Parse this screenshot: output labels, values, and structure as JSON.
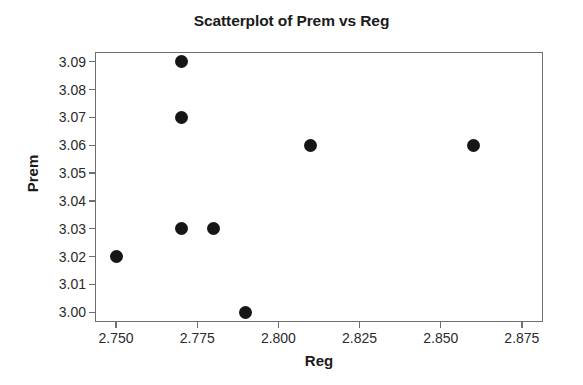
{
  "chart_data": {
    "type": "scatter",
    "title": "Scatterplot of Prem vs Reg",
    "xlabel": "Reg",
    "ylabel": "Prem",
    "xlim": [
      2.7435,
      2.8815
    ],
    "ylim": [
      2.9965,
      3.0935
    ],
    "grid": false,
    "legend": null,
    "xticks": [
      2.75,
      2.775,
      2.8,
      2.825,
      2.85,
      2.875
    ],
    "xtick_labels": [
      "2.750",
      "2.775",
      "2.800",
      "2.825",
      "2.850",
      "2.875"
    ],
    "yticks": [
      3.0,
      3.01,
      3.02,
      3.03,
      3.04,
      3.05,
      3.06,
      3.07,
      3.08,
      3.09
    ],
    "ytick_labels": [
      "3.00",
      "3.01",
      "3.02",
      "3.03",
      "3.04",
      "3.05",
      "3.06",
      "3.07",
      "3.08",
      "3.09"
    ],
    "marker": "filled-circle",
    "marker_color": "#161616",
    "x": [
      2.75,
      2.77,
      2.77,
      2.77,
      2.78,
      2.79,
      2.81,
      2.86
    ],
    "y": [
      3.02,
      3.09,
      3.07,
      3.03,
      3.03,
      3.0,
      3.06,
      3.06
    ],
    "points": [
      {
        "x": 2.75,
        "y": 3.02
      },
      {
        "x": 2.77,
        "y": 3.09
      },
      {
        "x": 2.77,
        "y": 3.07
      },
      {
        "x": 2.77,
        "y": 3.03
      },
      {
        "x": 2.78,
        "y": 3.03
      },
      {
        "x": 2.79,
        "y": 3.0
      },
      {
        "x": 2.81,
        "y": 3.06
      },
      {
        "x": 2.86,
        "y": 3.06
      }
    ]
  },
  "colors": {
    "axis": "#6f6f6f",
    "text": "#2b2b2b",
    "title": "#1b1b1b",
    "marker": "#161616",
    "background": "#ffffff"
  }
}
